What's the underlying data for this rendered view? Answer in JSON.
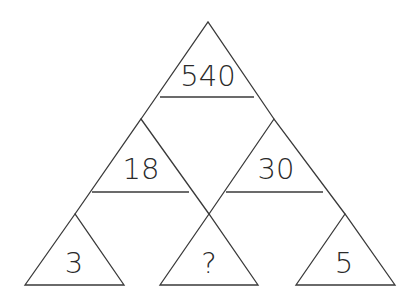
{
  "puzzle": {
    "type": "number-triangle-pyramid",
    "line_color": "#3a3a3a",
    "text_color": "#2a2a2a",
    "background": "#ffffff",
    "triangles": {
      "top": {
        "label": "540",
        "apex": [
          208,
          22
        ],
        "base_y": 97,
        "base_left": 160,
        "base_right": 254
      },
      "mid_left": {
        "label": "18",
        "apex": [
          141,
          119
        ],
        "base_y": 192,
        "base_left": 92,
        "base_right": 189
      },
      "mid_right": {
        "label": "30",
        "apex": [
          274,
          119
        ],
        "base_y": 192,
        "base_left": 226,
        "base_right": 323
      },
      "bottom_left": {
        "label": "3",
        "apex": [
          75,
          214
        ],
        "base_y": 285,
        "base_left": 25,
        "base_right": 124
      },
      "bottom_middle": {
        "label": "?",
        "apex": [
          209,
          214
        ],
        "base_y": 285,
        "base_left": 160,
        "base_right": 258
      },
      "bottom_right": {
        "label": "5",
        "apex": [
          345,
          214
        ],
        "base_y": 285,
        "base_left": 296,
        "base_right": 395
      }
    }
  }
}
